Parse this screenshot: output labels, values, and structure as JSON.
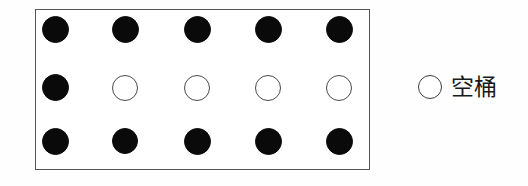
{
  "figure": {
    "name": "bucket-grid-diagram",
    "background_color": "#fefefe"
  },
  "grid_box": {
    "border_color": "#555555",
    "fill_color": "#ffffff",
    "rows": 3,
    "columns": 5,
    "circle_diameter_px": 27,
    "column_centers_x": [
      54,
      124,
      196,
      267,
      338
    ],
    "row_centers_y": [
      29,
      87,
      141
    ],
    "cells": [
      [
        {
          "state": "filled",
          "icon": "filled-circle-icon"
        },
        {
          "state": "filled",
          "icon": "filled-circle-icon"
        },
        {
          "state": "filled",
          "icon": "filled-circle-icon"
        },
        {
          "state": "filled",
          "icon": "filled-circle-icon"
        },
        {
          "state": "filled",
          "icon": "filled-circle-icon"
        }
      ],
      [
        {
          "state": "filled",
          "icon": "filled-circle-icon"
        },
        {
          "state": "empty",
          "icon": "empty-circle-icon"
        },
        {
          "state": "empty",
          "icon": "empty-circle-icon"
        },
        {
          "state": "empty",
          "icon": "empty-circle-icon"
        },
        {
          "state": "empty",
          "icon": "empty-circle-icon"
        }
      ],
      [
        {
          "state": "filled",
          "icon": "filled-circle-icon"
        },
        {
          "state": "filled",
          "icon": "filled-circle-icon"
        },
        {
          "state": "filled",
          "icon": "filled-circle-icon"
        },
        {
          "state": "filled",
          "icon": "filled-circle-icon"
        },
        {
          "state": "filled",
          "icon": "filled-circle-icon"
        }
      ]
    ],
    "counts": {
      "filled": 11,
      "empty": 4,
      "total": 15
    }
  },
  "legend": {
    "items": [
      {
        "icon": "empty-circle-icon",
        "label": "空桶",
        "swatch_fill": "#ffffff",
        "swatch_border": "#3c3c3c"
      }
    ]
  },
  "colors": {
    "filled_circle": "#0a0a0a",
    "empty_circle_stroke": "#4a4a4a",
    "box_border": "#555555",
    "text": "#1a1a1a"
  }
}
